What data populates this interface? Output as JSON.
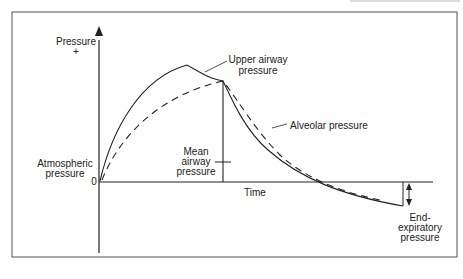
{
  "diagram": {
    "y_axis": {
      "label": "Pressure",
      "sign": "+"
    },
    "x_axis": {
      "label": "Time",
      "origin": "0"
    },
    "labels": {
      "upper_airway": [
        "Upper airway",
        "pressure"
      ],
      "alveolar": "Alveolar pressure",
      "mean_airway": [
        "Mean",
        "airway",
        "pressure"
      ],
      "atmospheric": [
        "Atmospheric",
        "pressure"
      ],
      "end_expiratory": [
        "End-",
        "expiratory",
        "pressure"
      ]
    },
    "series": [
      {
        "name": "Upper airway pressure",
        "style": "solid"
      },
      {
        "name": "Alveolar pressure",
        "style": "dashed"
      }
    ]
  }
}
